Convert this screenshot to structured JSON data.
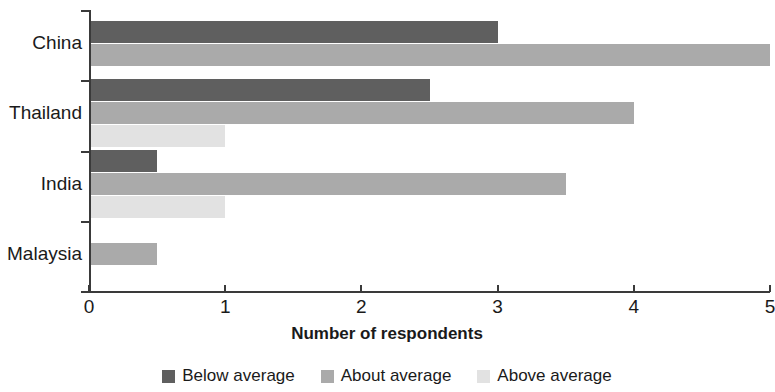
{
  "chart_data": {
    "type": "bar",
    "orientation": "horizontal",
    "title": "",
    "xlabel": "Number of respondents",
    "ylabel": "",
    "xlim": [
      0,
      5
    ],
    "xticks": [
      "0",
      "1",
      "2",
      "3",
      "4",
      "5"
    ],
    "grid": false,
    "legend_position": "bottom",
    "categories": [
      "China",
      "Thailand",
      "India",
      "Malaysia"
    ],
    "series": [
      {
        "name": "Below average",
        "color": "#5f5f5f",
        "values": [
          3,
          2.5,
          0.5,
          0
        ]
      },
      {
        "name": "About average",
        "color": "#aaaaaa",
        "values": [
          5,
          4,
          3.5,
          0.5
        ]
      },
      {
        "name": "Above average",
        "color": "#e2e2e2",
        "values": [
          0,
          1,
          1,
          0
        ]
      }
    ]
  },
  "axis": {
    "x_title": "Number of respondents"
  },
  "legend": {
    "items": [
      {
        "label": "Below average",
        "color": "#5f5f5f"
      },
      {
        "label": "About average",
        "color": "#aaaaaa"
      },
      {
        "label": "Above average",
        "color": "#e2e2e2"
      }
    ]
  }
}
